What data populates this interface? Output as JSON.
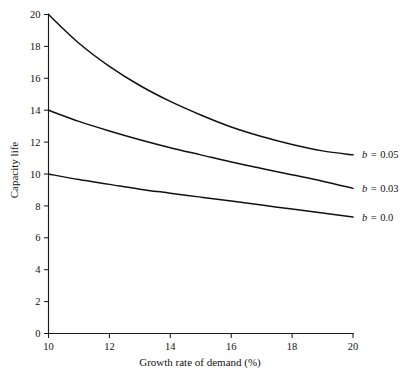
{
  "chart_data": {
    "type": "line",
    "title": "",
    "xlabel": "Growth rate of demand (%)",
    "ylabel": "Capacity life",
    "xlim": [
      10,
      20
    ],
    "ylim": [
      0,
      20
    ],
    "xticks": [
      10,
      12,
      14,
      16,
      18,
      20
    ],
    "yticks": [
      0,
      2,
      4,
      6,
      8,
      10,
      12,
      14,
      16,
      18,
      20
    ],
    "xtick_labels": [
      "10",
      "12",
      "14",
      "16",
      "18",
      "20"
    ],
    "ytick_labels": [
      "0",
      "2",
      "4",
      "6",
      "8",
      "10",
      "12",
      "14",
      "16",
      "18",
      "20"
    ],
    "grid": false,
    "legend_position": "right-inline-end-of-curve",
    "line_color": "#111111",
    "x": [
      10,
      11,
      12,
      13,
      14,
      15,
      16,
      17,
      18,
      19,
      20
    ],
    "series": [
      {
        "name": "b = 0.05",
        "label_b": "b",
        "label_eq": "=",
        "label_value": "0.05",
        "values": [
          20.0,
          18.2,
          16.75,
          15.55,
          14.55,
          13.7,
          12.95,
          12.35,
          11.85,
          11.45,
          11.2
        ]
      },
      {
        "name": "b = 0.03",
        "label_b": "b",
        "label_eq": "=",
        "label_value": "0.03",
        "values": [
          14.0,
          13.3,
          12.7,
          12.15,
          11.65,
          11.2,
          10.75,
          10.35,
          9.95,
          9.55,
          9.1
        ]
      },
      {
        "name": "b = 0.0",
        "label_b": "b",
        "label_eq": "=",
        "label_value": "0.0",
        "values": [
          10.0,
          9.65,
          9.35,
          9.05,
          8.8,
          8.55,
          8.3,
          8.05,
          7.8,
          7.55,
          7.3
        ]
      }
    ]
  },
  "axes": {
    "x_title": "Growth rate of demand (%)",
    "y_title": "Capacity life"
  },
  "legend": {
    "entries": [
      {
        "b": "b",
        "eq": "=",
        "value": "0.05"
      },
      {
        "b": "b",
        "eq": "=",
        "value": "0.03"
      },
      {
        "b": "b",
        "eq": "=",
        "value": "0.0"
      }
    ]
  }
}
